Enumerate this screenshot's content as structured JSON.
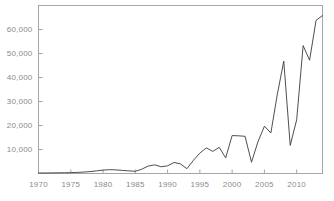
{
  "chart_data": {
    "type": "line",
    "title": "",
    "subtitle": "",
    "xlabel": "",
    "ylabel": "",
    "xlim": [
      1970,
      2014
    ],
    "ylim": [
      0,
      70000
    ],
    "grid": false,
    "legend": false,
    "legend_position": "none",
    "line_color": "#3a3a3a",
    "axis_color": "#a6a6a6",
    "tick_label_color": "#8a8a8a",
    "background_color": "#ffffff",
    "y_ticks": [
      {
        "value": 10000,
        "label": "10,000"
      },
      {
        "value": 20000,
        "label": "20,000"
      },
      {
        "value": 30000,
        "label": "30,000"
      },
      {
        "value": 40000,
        "label": "40,000"
      },
      {
        "value": 50000,
        "label": "50,000"
      },
      {
        "value": 60000,
        "label": "60,000"
      }
    ],
    "x_ticks": [
      {
        "value": 1970,
        "label": "1970"
      },
      {
        "value": 1975,
        "label": "1975"
      },
      {
        "value": 1980,
        "label": "1980"
      },
      {
        "value": 1985,
        "label": "1985"
      },
      {
        "value": 1990,
        "label": "1990"
      },
      {
        "value": 1995,
        "label": "1995"
      },
      {
        "value": 2000,
        "label": "2000"
      },
      {
        "value": 2005,
        "label": "2005"
      },
      {
        "value": 2010,
        "label": "2010"
      }
    ],
    "x": [
      1970,
      1971,
      1972,
      1973,
      1974,
      1975,
      1976,
      1977,
      1978,
      1979,
      1980,
      1981,
      1982,
      1983,
      1984,
      1985,
      1986,
      1987,
      1988,
      1989,
      1990,
      1991,
      1992,
      1993,
      1994,
      1995,
      1996,
      1997,
      1998,
      1999,
      2000,
      2001,
      2002,
      2003,
      2004,
      2005,
      2006,
      2007,
      2008,
      2009,
      2010,
      2011,
      2012,
      2013,
      2014
    ],
    "values": [
      200,
      220,
      250,
      280,
      300,
      350,
      450,
      600,
      800,
      1100,
      1400,
      1600,
      1500,
      1300,
      1100,
      900,
      1800,
      3100,
      3600,
      2800,
      3200,
      4600,
      4000,
      2000,
      5500,
      8500,
      10700,
      9200,
      10900,
      6500,
      15800,
      15700,
      15500,
      4700,
      13200,
      19700,
      16900,
      33000,
      46800,
      11700,
      22400,
      53300,
      47200,
      63800,
      65800
    ]
  }
}
